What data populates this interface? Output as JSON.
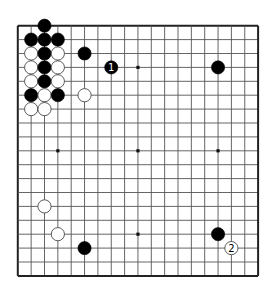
{
  "board": {
    "size": 19,
    "origin_x": 17.8,
    "origin_y": 25.7,
    "spacing_x": 13.35,
    "spacing_y": 13.9,
    "stone_radius": 6.6,
    "line_color": "#555555",
    "border_color": "#222222",
    "background": "#ffffff",
    "black_color": "#000000",
    "white_fill": "#ffffff",
    "white_stroke": "#333333",
    "star_points": [
      [
        3,
        3
      ],
      [
        9,
        3
      ],
      [
        15,
        3
      ],
      [
        3,
        9
      ],
      [
        9,
        9
      ],
      [
        15,
        9
      ],
      [
        3,
        15
      ],
      [
        9,
        15
      ],
      [
        15,
        15
      ]
    ]
  },
  "stones": [
    {
      "color": "black",
      "col": 2,
      "row": 0,
      "label": ""
    },
    {
      "color": "black",
      "col": 1,
      "row": 1,
      "label": ""
    },
    {
      "color": "black",
      "col": 2,
      "row": 1,
      "label": ""
    },
    {
      "color": "black",
      "col": 3,
      "row": 1,
      "label": ""
    },
    {
      "color": "white",
      "col": 1,
      "row": 2,
      "label": ""
    },
    {
      "color": "black",
      "col": 2,
      "row": 2,
      "label": ""
    },
    {
      "color": "white",
      "col": 3,
      "row": 2,
      "label": ""
    },
    {
      "color": "white",
      "col": 1,
      "row": 3,
      "label": ""
    },
    {
      "color": "black",
      "col": 2,
      "row": 3,
      "label": ""
    },
    {
      "color": "white",
      "col": 3,
      "row": 3,
      "label": ""
    },
    {
      "color": "white",
      "col": 1,
      "row": 4,
      "label": ""
    },
    {
      "color": "black",
      "col": 2,
      "row": 4,
      "label": ""
    },
    {
      "color": "white",
      "col": 3,
      "row": 4,
      "label": ""
    },
    {
      "color": "black",
      "col": 1,
      "row": 5,
      "label": ""
    },
    {
      "color": "white",
      "col": 2,
      "row": 5,
      "label": ""
    },
    {
      "color": "black",
      "col": 3,
      "row": 5,
      "label": ""
    },
    {
      "color": "white",
      "col": 1,
      "row": 6,
      "label": ""
    },
    {
      "color": "white",
      "col": 2,
      "row": 6,
      "label": ""
    },
    {
      "color": "black",
      "col": 5,
      "row": 2,
      "label": ""
    },
    {
      "color": "black",
      "col": 7,
      "row": 3,
      "label": "1"
    },
    {
      "color": "white",
      "col": 5,
      "row": 5,
      "label": ""
    },
    {
      "color": "black",
      "col": 15,
      "row": 3,
      "label": ""
    },
    {
      "color": "white",
      "col": 2,
      "row": 13,
      "label": ""
    },
    {
      "color": "white",
      "col": 3,
      "row": 15,
      "label": ""
    },
    {
      "color": "black",
      "col": 5,
      "row": 16,
      "label": ""
    },
    {
      "color": "black",
      "col": 15,
      "row": 15,
      "label": ""
    },
    {
      "color": "white",
      "col": 16,
      "row": 16,
      "label": "2"
    }
  ]
}
